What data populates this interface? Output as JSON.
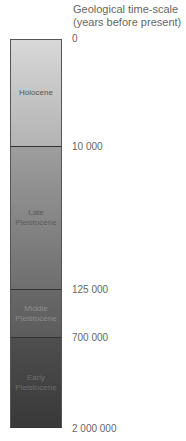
{
  "title": {
    "line1": "Geological time-scale",
    "line2": "(years before present)"
  },
  "epochs": [
    {
      "label_line1": "Holocene",
      "label_line2": "",
      "color_top": "#d8d8d8",
      "color_bottom": "#b5b5b5",
      "text_color": "#555555"
    },
    {
      "label_line1": "Late",
      "label_line2": "Pleistocene",
      "color_top": "#9c9c9c",
      "color_bottom": "#6f6f6f",
      "text_color": "#5a5a5a"
    },
    {
      "label_line1": "Middle",
      "label_line2": "Pleistocene",
      "color_top": "#666666",
      "color_bottom": "#5e5e5e",
      "text_color": "#8a8a8a"
    },
    {
      "label_line1": "Early",
      "label_line2": "Pleistocene",
      "color_top": "#4c4c4c",
      "color_bottom": "#3a3a3a",
      "text_color": "#6e6e6e"
    }
  ],
  "ticks": [
    "0",
    "10 000",
    "125 000",
    "700 000",
    "2 000 000"
  ]
}
